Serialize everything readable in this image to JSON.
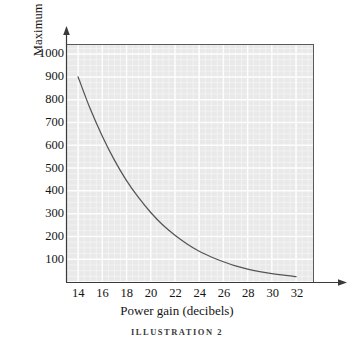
{
  "chart_data": {
    "type": "line",
    "title": "",
    "caption": "ILLUSTRATION 2",
    "xlabel": "Power gain (decibels)",
    "ylabel": "Maximum power output (milliwatts)",
    "xlim": [
      13.0,
      33.4
    ],
    "ylim": [
      0,
      1040
    ],
    "xticks": [
      14,
      16,
      18,
      20,
      22,
      24,
      26,
      28,
      30,
      32
    ],
    "yticks": [
      100,
      200,
      300,
      400,
      500,
      600,
      700,
      800,
      900,
      1000
    ],
    "xtick_labels": [
      "14",
      "16",
      "18",
      "20",
      "22",
      "24",
      "26",
      "28",
      "30",
      "32"
    ],
    "ytick_labels": [
      "100",
      "200",
      "300",
      "400",
      "500",
      "600",
      "700",
      "800",
      "900",
      "1000"
    ],
    "grid": true,
    "grid_color": "#ffffff",
    "panel_color": "#e9e9e9",
    "legend": null,
    "series": [
      {
        "name": "Maximum power output",
        "color": "#555555",
        "x": [
          14,
          15,
          16,
          17,
          18,
          19,
          20,
          21,
          22,
          23,
          24,
          25,
          26,
          27,
          28,
          29,
          30,
          31,
          32
        ],
        "y": [
          900,
          760,
          640,
          535,
          445,
          370,
          305,
          250,
          205,
          167,
          135,
          110,
          89,
          71,
          57,
          46,
          37,
          30,
          24
        ]
      }
    ]
  },
  "figure": {
    "axis_color": "#3a3a3a",
    "text_color": "#141414"
  }
}
